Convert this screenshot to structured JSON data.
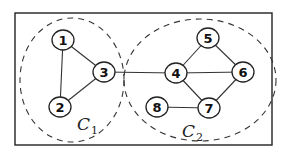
{
  "diagram": {
    "type": "graph-clustering",
    "frame": {
      "x": 15,
      "y": 13,
      "width": 257,
      "height": 132
    },
    "clusters": [
      {
        "id": "C1",
        "label": "C",
        "subscript": "1",
        "members": [
          "1",
          "2",
          "3"
        ],
        "cx": 72,
        "cy": 80,
        "rx": 52,
        "ry": 62,
        "label_x": 77,
        "label_y": 130
      },
      {
        "id": "C2",
        "label": "C",
        "subscript": "2",
        "members": [
          "4",
          "5",
          "6",
          "7",
          "8"
        ],
        "cx": 200,
        "cy": 80,
        "rx": 76,
        "ry": 61,
        "label_x": 182,
        "label_y": 137
      }
    ],
    "nodes": [
      {
        "id": "1",
        "label": "1",
        "x": 63,
        "y": 40
      },
      {
        "id": "2",
        "label": "2",
        "x": 60,
        "y": 107
      },
      {
        "id": "3",
        "label": "3",
        "x": 104,
        "y": 72
      },
      {
        "id": "4",
        "label": "4",
        "x": 176,
        "y": 73
      },
      {
        "id": "5",
        "label": "5",
        "x": 208,
        "y": 38
      },
      {
        "id": "6",
        "label": "6",
        "x": 243,
        "y": 72
      },
      {
        "id": "7",
        "label": "7",
        "x": 209,
        "y": 108
      },
      {
        "id": "8",
        "label": "8",
        "x": 157,
        "y": 107
      }
    ],
    "edges": [
      [
        "1",
        "2"
      ],
      [
        "1",
        "3"
      ],
      [
        "2",
        "3"
      ],
      [
        "3",
        "4"
      ],
      [
        "4",
        "5"
      ],
      [
        "4",
        "6"
      ],
      [
        "4",
        "7"
      ],
      [
        "5",
        "6"
      ],
      [
        "6",
        "7"
      ],
      [
        "7",
        "8"
      ]
    ]
  }
}
